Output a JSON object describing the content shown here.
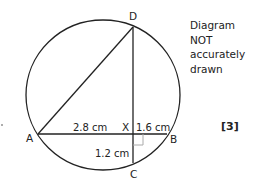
{
  "diagram": {
    "points": {
      "A": {
        "label": "A",
        "x": 38,
        "y": 134
      },
      "B": {
        "label": "B",
        "x": 167,
        "y": 134
      },
      "C": {
        "label": "C",
        "x": 133,
        "y": 163
      },
      "D": {
        "label": "D",
        "x": 133,
        "y": 27
      },
      "X": {
        "label": "X",
        "x": 133,
        "y": 134
      }
    },
    "circle": {
      "cx": 103,
      "cy": 95,
      "r": 76
    },
    "measurements": {
      "AX": "2.8 cm",
      "XB": "1.6 cm",
      "XC": "1.2 cm"
    },
    "note_lines": [
      "Diagram",
      "NOT",
      "accurately",
      "drawn"
    ],
    "marks": "[3]",
    "colors": {
      "stroke": "#222222",
      "right_angle": "#aaaaaa"
    }
  }
}
